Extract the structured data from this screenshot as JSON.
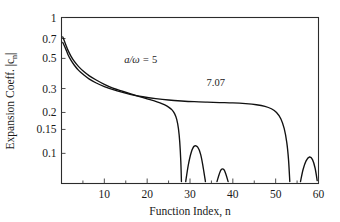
{
  "chart_data": {
    "type": "line",
    "title": "",
    "xlabel": "Function Index, n",
    "ylabel": "Expansion Coeff. |c_n|",
    "ylabel_parts": {
      "main": "Expansion Coeff. |c",
      "subscript": "n",
      "tail": "|"
    },
    "yscale": "log",
    "xlim": [
      0,
      60
    ],
    "ylim": [
      0.06,
      1.0
    ],
    "grid": false,
    "legend_position": "inline-annotations",
    "xticks": [
      10,
      20,
      30,
      40,
      50,
      60
    ],
    "xtick_labels": [
      "10",
      "20",
      "30",
      "40",
      "50",
      "60"
    ],
    "xminor_ticks": [
      5,
      15,
      25,
      35,
      45,
      55
    ],
    "yticks": [
      1,
      0.7,
      0.5,
      0.3,
      0.2,
      0.15,
      0.1
    ],
    "ytick_labels": [
      "1",
      "0.7",
      "0.5",
      "0.3",
      "0.2",
      "0.15",
      "0.1"
    ],
    "annotations": [
      {
        "name": "curve-label-a-over-omega",
        "text": "a/ω = 5",
        "text_num": "5",
        "x": 18.5,
        "y": 0.46
      },
      {
        "name": "curve-label-7-07",
        "text": "7.07",
        "x": 36.0,
        "y": 0.315
      }
    ],
    "series": [
      {
        "name": "a/omega = 5",
        "label": "a/ω = 5",
        "x": [
          0.3,
          0.6,
          1.0,
          1.5,
          2.2,
          3.0,
          4.0,
          5.2,
          6.5,
          8.0,
          10.0,
          12.0,
          14.0,
          16.0,
          18.0,
          20.0,
          21.5,
          23.0,
          24.0,
          25.0,
          25.8,
          26.4,
          26.9,
          27.3,
          27.6,
          27.85,
          28.0
        ],
        "y": [
          0.72,
          0.68,
          0.63,
          0.575,
          0.52,
          0.475,
          0.435,
          0.4,
          0.372,
          0.348,
          0.322,
          0.302,
          0.288,
          0.275,
          0.263,
          0.252,
          0.244,
          0.235,
          0.228,
          0.219,
          0.209,
          0.196,
          0.178,
          0.152,
          0.122,
          0.088,
          0.062
        ]
      },
      {
        "name": "a/omega = 7.07",
        "label": "7.07",
        "x": [
          0.3,
          0.6,
          1.0,
          1.5,
          2.2,
          3.0,
          4.0,
          5.2,
          6.5,
          8.0,
          10.0,
          13.0,
          16.0,
          19.0,
          22.0,
          25.0,
          28.0,
          31.0,
          34.0,
          37.0,
          40.0,
          43.0,
          45.5,
          47.5,
          49.0,
          50.2,
          51.2,
          52.0,
          52.6,
          53.0,
          53.3
        ],
        "y": [
          0.655,
          0.625,
          0.585,
          0.535,
          0.485,
          0.445,
          0.408,
          0.378,
          0.352,
          0.331,
          0.31,
          0.288,
          0.272,
          0.261,
          0.253,
          0.247,
          0.243,
          0.24,
          0.238,
          0.2365,
          0.235,
          0.232,
          0.228,
          0.222,
          0.213,
          0.2,
          0.18,
          0.152,
          0.12,
          0.09,
          0.062
        ]
      },
      {
        "name": "sidelobe-1",
        "label": "",
        "x": [
          29.0,
          29.6,
          30.3,
          31.0,
          31.8,
          32.5,
          33.1,
          33.6
        ],
        "y": [
          0.062,
          0.082,
          0.102,
          0.113,
          0.111,
          0.098,
          0.078,
          0.062
        ]
      },
      {
        "name": "sidelobe-2",
        "label": "",
        "x": [
          36.3,
          36.8,
          37.3,
          37.9,
          38.4,
          38.9
        ],
        "y": [
          0.062,
          0.07,
          0.076,
          0.076,
          0.07,
          0.062
        ]
      },
      {
        "name": "sidelobe-3",
        "label": "",
        "x": [
          55.8,
          56.4,
          57.1,
          57.9,
          58.6,
          59.2,
          59.7
        ],
        "y": [
          0.062,
          0.076,
          0.088,
          0.094,
          0.09,
          0.078,
          0.063
        ]
      }
    ]
  }
}
